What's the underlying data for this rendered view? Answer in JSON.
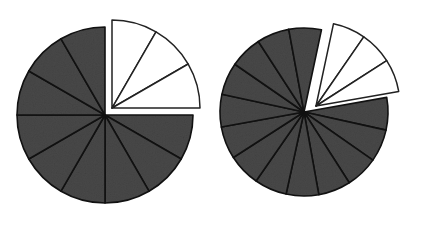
{
  "figure": {
    "background_color": "#ffffff",
    "shaded_color": "#484848",
    "unshaded_color": "#ffffff",
    "outline_color": "#111111",
    "width": 432,
    "height": 225
  },
  "chart_data": {
    "type": "pie",
    "xlabel": "",
    "ylabel": "",
    "grid": false,
    "legend": "none",
    "charts": [
      {
        "name": "left-pie",
        "total_slices": 12,
        "shaded_slices": 9,
        "unshaded_slices": 3,
        "fraction": "9/12",
        "fraction_value": 0.75,
        "center_x": 105,
        "center_y": 115,
        "radius": 88,
        "slice_angle_degrees": 30,
        "unshaded_start_angle_degrees": -90,
        "unshaded_end_angle_degrees": 0,
        "exploded": true,
        "explode_offset_x": 7,
        "explode_offset_y": -7,
        "categories": [
          "shaded",
          "unshaded"
        ],
        "values": [
          9,
          3
        ]
      },
      {
        "name": "right-pie",
        "total_slices": 16,
        "shaded_slices": 13,
        "unshaded_slices": 3,
        "fraction": "12/16",
        "fraction_value": 0.75,
        "center_x": 304,
        "center_y": 112,
        "radius": 84,
        "slice_angle_degrees": 22.5,
        "unshaded_start_angle_degrees": -78,
        "unshaded_end_angle_degrees": -10,
        "exploded": true,
        "explode_offset_x": 12,
        "explode_offset_y": -6,
        "categories": [
          "shaded",
          "unshaded"
        ],
        "values": [
          13,
          3
        ]
      }
    ]
  }
}
